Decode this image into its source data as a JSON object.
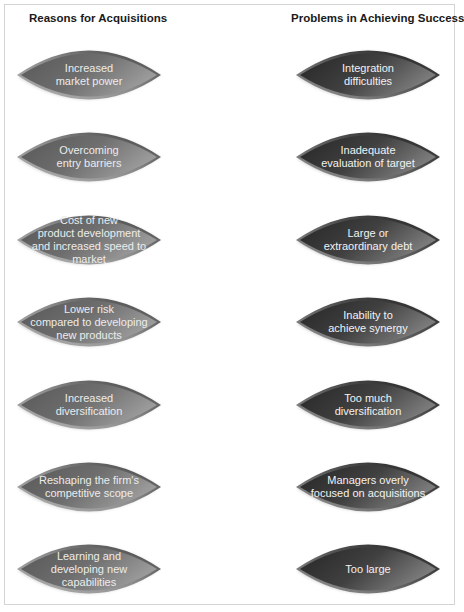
{
  "left_column": {
    "title": "Reasons for Acquisitions",
    "items": [
      {
        "label": "Increased\nmarket power"
      },
      {
        "label": "Overcoming\nentry barriers"
      },
      {
        "label": "Cost of new\nproduct development\nand increased speed to\nmarket"
      },
      {
        "label": "Lower risk\ncompared to developing\nnew products"
      },
      {
        "label": "Increased\ndiversification"
      },
      {
        "label": "Reshaping the firm's\ncompetitive scope"
      },
      {
        "label": "Learning and\ndeveloping new\ncapabilities"
      }
    ]
  },
  "right_column": {
    "title": "Problems in Achieving Success",
    "items": [
      {
        "label": "Integration\ndifficulties"
      },
      {
        "label": "Inadequate\nevaluation of target"
      },
      {
        "label": "Large or\nextraordinary debt"
      },
      {
        "label": "Inability to\nachieve synergy"
      },
      {
        "label": "Too  much\ndiversification"
      },
      {
        "label": "Managers overly\nfocused on acquisitions"
      },
      {
        "label": "Too large"
      }
    ]
  },
  "colors": {
    "left_fill_dark": "#5e5e5e",
    "left_fill_light": "#8a8a8a",
    "right_fill_dark": "#2e2e2e",
    "right_fill_light": "#6c6c6c",
    "rim_light": "#a8a8a8",
    "rim_dark": "#2a2a2a"
  }
}
